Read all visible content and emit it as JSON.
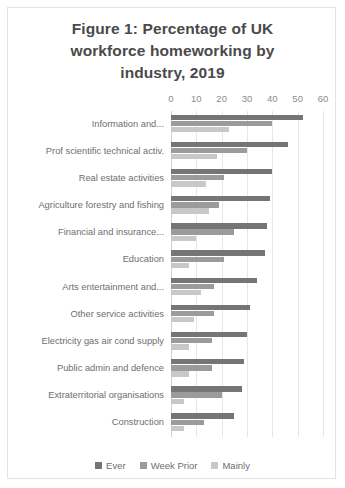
{
  "figure": {
    "title": "Figure 1: Percentage of UK workforce homeworking by industry, 2019",
    "title_line1": "Figure 1: Percentage of UK",
    "title_line2": "workforce homeworking by",
    "title_line3": "industry, 2019"
  },
  "colors": {
    "ever": "#757575",
    "week_prior": "#9b9b9b",
    "mainly": "#c8c8c8",
    "gridline": "#e6e6e6",
    "text": "#6e6e6e",
    "border": "#e3e3e3",
    "background": "#ffffff"
  },
  "legend": {
    "position": "bottom-center",
    "items": [
      {
        "label": "Ever",
        "color": "#757575"
      },
      {
        "label": "Week Prior",
        "color": "#9b9b9b"
      },
      {
        "label": "Mainly",
        "color": "#c8c8c8"
      }
    ]
  },
  "axis": {
    "ticks": [
      "0",
      "10",
      "20",
      "30",
      "40",
      "50",
      "60"
    ],
    "tick_values": [
      0,
      10,
      20,
      30,
      40,
      50,
      60
    ],
    "min": 0,
    "max": 60
  },
  "chart_data": {
    "type": "bar",
    "orientation": "horizontal",
    "title": "Figure 1: Percentage of UK workforce homeworking by industry, 2019",
    "xlabel": "",
    "ylabel": "",
    "xlim": [
      0,
      60
    ],
    "grid": true,
    "legend_position": "bottom",
    "categories": [
      "Information and...",
      "Prof scientific technical activ.",
      "Real estate activities",
      "Agriculture forestry and fishing",
      "Financial and insurance...",
      "Education",
      "Arts entertainment and...",
      "Other service activities",
      "Electricity gas air cond supply",
      "Public admin and defence",
      "Extraterritorial organisations",
      "Construction"
    ],
    "series": [
      {
        "name": "Ever",
        "color": "#757575",
        "values": [
          52,
          46,
          40,
          39,
          38,
          37,
          34,
          31,
          30,
          29,
          28,
          25
        ]
      },
      {
        "name": "Week Prior",
        "color": "#9b9b9b",
        "values": [
          40,
          30,
          21,
          19,
          25,
          21,
          17,
          17,
          16,
          16,
          20,
          13
        ]
      },
      {
        "name": "Mainly",
        "color": "#c8c8c8",
        "values": [
          23,
          18,
          14,
          15,
          10,
          7,
          12,
          9,
          7,
          7,
          5,
          5
        ]
      }
    ]
  }
}
